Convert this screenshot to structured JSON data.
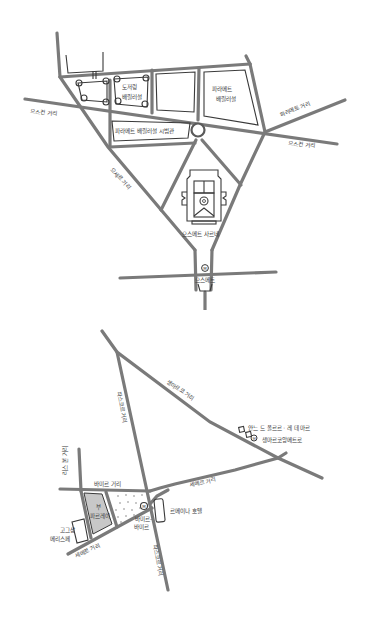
{
  "colors": {
    "background": "#ffffff",
    "road": "#7a7a7a",
    "ink": "#3a3a3a",
    "shaded_block": "#c8c8c8"
  },
  "top_map": {
    "street_labels": {
      "left_street": "으스컨 거리",
      "right_lower_street": "으스컨 거리",
      "right_upper_street": "파라메트 거리",
      "diagonal_street": "으세르 거리"
    },
    "buildings": {
      "block_left_label_line1": "도저렁",
      "block_left_label_line2": "배릴러설",
      "block_right_label_line1": "파라메트",
      "block_right_label_line2": "배릴러설",
      "block_long_label": "파라메트 배릴러설 시범관",
      "church_label": "으스메트 사르네",
      "station_label": "으스메트"
    },
    "icons": {
      "roundabout": "roundabout-circle",
      "metro": "metro-icon"
    }
  },
  "bottom_map": {
    "street_labels": {
      "top_diagonal": "생마르코 거리",
      "left_vertical": "리스 본 거리",
      "center_vertical_upper": "파스코르 거리",
      "center_vertical_lower": "파스코르 거리",
      "horizontal_left": "바미르 거리",
      "horizontal_right": "세메르 거리",
      "bottom_diagonal": "세메르 거리"
    },
    "places": {
      "shop_label_line1": "안느 드 폴르르 · 레 데 마르",
      "shop_label_line2": "생마르코앙메트로",
      "hotel_label": "르메이나 호텔",
      "shaded_block_label_line1": "부",
      "shaded_block_label_line2": "파르레이",
      "small_block_label_line1": "고그상",
      "small_block_label_line2": "메리스페",
      "station_label_line1": "바미르-",
      "station_label_line2": "바미르"
    },
    "icons": {
      "metro_main": "metro-icon",
      "metro_shop": "metro-icon"
    }
  }
}
